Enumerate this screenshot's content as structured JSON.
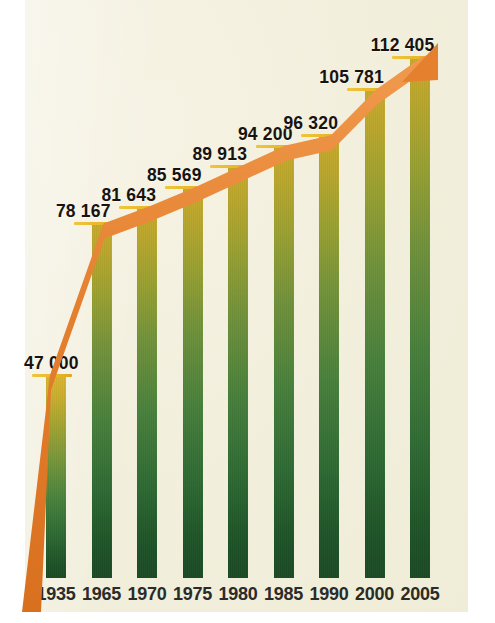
{
  "figure": {
    "title": "",
    "background_color": "#f2efdd",
    "paper_color": "#ffffff",
    "accent_color": "#e5802f",
    "tick_color": "#e8b72c",
    "bar_top_color": "#c9a92b",
    "bar_bottom_color": "#1b4a24",
    "label_color": "#171310",
    "caption": ""
  },
  "chart_data": {
    "type": "bar",
    "title": "",
    "subtitle": "",
    "xlabel": "",
    "ylabel": "",
    "grid": false,
    "legend": "none",
    "ylim": [
      0,
      118000
    ],
    "categories": [
      "1935",
      "1965",
      "1970",
      "1975",
      "1980",
      "1985",
      "1990",
      "2000",
      "2005"
    ],
    "values": [
      47000,
      78167,
      81643,
      85569,
      89913,
      94200,
      96320,
      105781,
      112405
    ],
    "value_labels": [
      "47 000",
      "78 167",
      "81 643",
      "85 569",
      "89 913",
      "94 200",
      "96 320",
      "105 781",
      "112 405"
    ],
    "tick_labels": [
      "1935",
      "1965",
      "1970",
      "1975",
      "1980",
      "1985",
      "1990",
      "2000",
      "2005"
    ],
    "annotations": [
      {
        "name": "trend-arrow",
        "description": "orange ascending arrow connecting bar tops",
        "color": "#e5802f"
      }
    ],
    "series": [
      {
        "name": "total",
        "values": [
          47000,
          78167,
          81643,
          85569,
          89913,
          94200,
          96320,
          105781,
          112405
        ]
      }
    ]
  },
  "bars": [
    {
      "year": "1935",
      "label": "47 000",
      "value": 47000
    },
    {
      "year": "1965",
      "label": "78 167",
      "value": 78167
    },
    {
      "year": "1970",
      "label": "81 643",
      "value": 81643
    },
    {
      "year": "1975",
      "label": "85 569",
      "value": 85569
    },
    {
      "year": "1980",
      "label": "89 913",
      "value": 89913
    },
    {
      "year": "1985",
      "label": "94 200",
      "value": 94200
    },
    {
      "year": "1990",
      "label": "96 320",
      "value": 96320
    },
    {
      "year": "2000",
      "label": "105 781",
      "value": 105781
    },
    {
      "year": "2005",
      "label": "112 405",
      "value": 112405
    }
  ]
}
